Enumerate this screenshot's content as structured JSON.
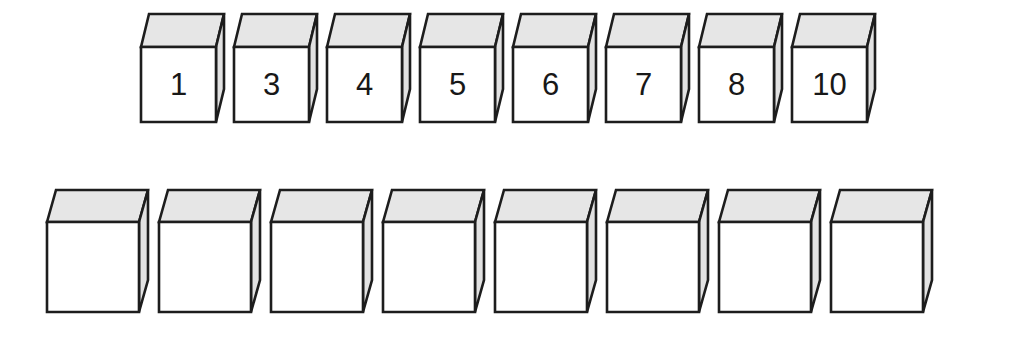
{
  "page": {
    "background_color": "#ffffff",
    "width": 1033,
    "height": 351
  },
  "style": {
    "outline_color": "#1d1d1d",
    "front_face_color": "#ffffff",
    "top_face_color": "#e6e6e6",
    "side_face_color": "#e2e2e2",
    "label_color": "#181818",
    "stroke_width": 2.6
  },
  "rows": [
    {
      "name": "numbered-cube-row",
      "origin_x": 141,
      "origin_y": 47,
      "face_width": 75,
      "face_height": 75,
      "depth_x": 8,
      "depth_y": -33,
      "pitch": 93,
      "label_font_size": 31,
      "cubes": [
        {
          "label": "1"
        },
        {
          "label": "3"
        },
        {
          "label": "4"
        },
        {
          "label": "5"
        },
        {
          "label": "6"
        },
        {
          "label": "7"
        },
        {
          "label": "8"
        },
        {
          "label": "10"
        }
      ]
    },
    {
      "name": "blank-cube-row",
      "origin_x": 47,
      "origin_y": 222,
      "face_width": 92,
      "face_height": 90,
      "depth_x": 9,
      "depth_y": -32,
      "pitch": 112,
      "label_font_size": 31,
      "cubes": [
        {
          "label": ""
        },
        {
          "label": ""
        },
        {
          "label": ""
        },
        {
          "label": ""
        },
        {
          "label": ""
        },
        {
          "label": ""
        },
        {
          "label": ""
        },
        {
          "label": ""
        }
      ]
    }
  ]
}
